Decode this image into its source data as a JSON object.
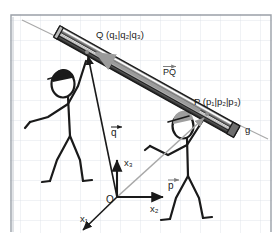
{
  "figure": {
    "background": "#ffffff",
    "grid_color": "#d9dee6",
    "grid_spacing": 20,
    "frame_color": "#9aa0a8"
  },
  "labels": {
    "point_q": "Q (q₁|q₂|q₃)",
    "point_p": "P (p₁|p₂|p₃)",
    "line_g": "g",
    "vector_pq": "PQ",
    "vector_q": "q",
    "vector_p": "p",
    "origin": "O",
    "axis_x1": "x₁",
    "axis_x2": "x₂",
    "axis_x3": "x₃"
  },
  "colors": {
    "ink": "#1a1a1a",
    "beam_dark": "#2b2b2b",
    "beam_mid": "#8a8a8a",
    "beam_light": "#e8e8e8",
    "vector_gray": "#9b9b9b",
    "line_g": "#a9a9a9",
    "hair_dark": "#1a1a1a",
    "hair_gray": "#9e9e9e"
  },
  "geometry": {
    "line_g": {
      "x1": 22,
      "y1": 20,
      "x2": 268,
      "y2": 139
    },
    "beam": {
      "x1": 57,
      "y1": 31,
      "x2": 237,
      "y2": 131
    },
    "point_q": {
      "x": 87,
      "y": 52
    },
    "point_p": {
      "x": 207,
      "y": 114
    },
    "origin": {
      "x": 117,
      "y": 197
    },
    "axis_x1_end": {
      "x": 82,
      "y": 231
    },
    "axis_x2_end": {
      "x": 164,
      "y": 197
    },
    "axis_x3_end": {
      "x": 117,
      "y": 157
    }
  },
  "figures": [
    {
      "name": "left-person",
      "hair": "dark"
    },
    {
      "name": "right-person",
      "hair": "gray"
    }
  ]
}
